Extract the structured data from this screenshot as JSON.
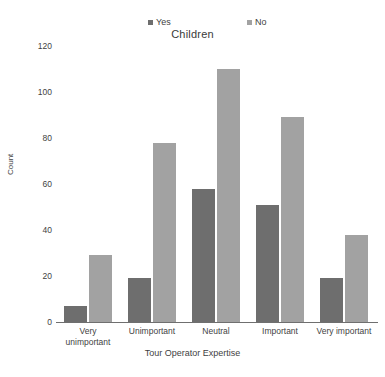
{
  "chart_data": {
    "type": "bar",
    "title": "Children",
    "xlabel": "Tour Operator Expertise",
    "ylabel": "Count",
    "categories": [
      "Very unimportant",
      "Unimportant",
      "Neutral",
      "Important",
      "Very important"
    ],
    "category_lines": [
      [
        "Very",
        "unimportant"
      ],
      [
        "Unimportant"
      ],
      [
        "Neutral"
      ],
      [
        "Important"
      ],
      [
        "Very important"
      ]
    ],
    "series": [
      {
        "name": "Yes",
        "color": "#6e6e6e",
        "values": [
          7,
          19,
          58,
          51,
          19
        ]
      },
      {
        "name": "No",
        "color": "#a2a2a2",
        "values": [
          29,
          78,
          110,
          89,
          38
        ]
      }
    ],
    "ylim": [
      0,
      120
    ],
    "yticks": [
      0,
      20,
      40,
      60,
      80,
      100,
      120
    ],
    "ytick_labels": [
      "0",
      "20",
      "40",
      "60",
      "80",
      "100",
      "120"
    ],
    "grid": false,
    "legend_position": "top-center"
  }
}
